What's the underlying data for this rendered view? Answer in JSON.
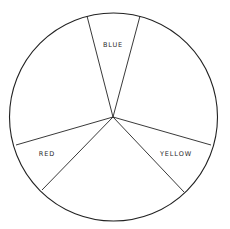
{
  "diagram": {
    "type": "color-wheel-sectors",
    "circle": {
      "cx": 113.5,
      "cy": 117,
      "r": 104
    },
    "center": {
      "x": 113,
      "y": 117
    },
    "stroke_color": "#222222",
    "background": "#ffffff",
    "lines": [
      {
        "name": "blue-left",
        "x2": 87,
        "y2": 16
      },
      {
        "name": "blue-right",
        "x2": 140,
        "y2": 16
      },
      {
        "name": "red-upper",
        "x2": 16,
        "y2": 145
      },
      {
        "name": "red-lower",
        "x2": 42,
        "y2": 190
      },
      {
        "name": "yellow-upper",
        "x2": 211,
        "y2": 145
      },
      {
        "name": "yellow-lower",
        "x2": 184,
        "y2": 192
      }
    ],
    "labels": {
      "blue": {
        "text": "BLUE",
        "x": 113,
        "y": 47
      },
      "red": {
        "text": "RED",
        "x": 47,
        "y": 156
      },
      "yellow": {
        "text": "YELLOW",
        "x": 176,
        "y": 156
      }
    }
  }
}
